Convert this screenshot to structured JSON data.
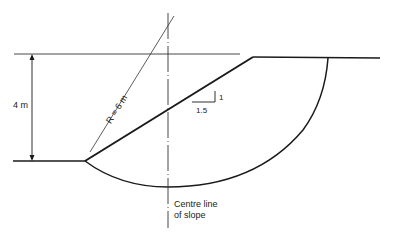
{
  "diagram": {
    "type": "slope-stability-cross-section",
    "labels": {
      "height": "4 m",
      "radius": "R = 6 m",
      "slope_vertical": "1",
      "slope_horizontal": "1.5",
      "centre_line_1": "Centre line",
      "centre_line_2": "of slope"
    },
    "values": {
      "slope_height_m": 4,
      "radius_m": 6,
      "slope_ratio": "1:1.5"
    },
    "colors": {
      "line": "#1a1a1a",
      "background": "#ffffff"
    }
  }
}
